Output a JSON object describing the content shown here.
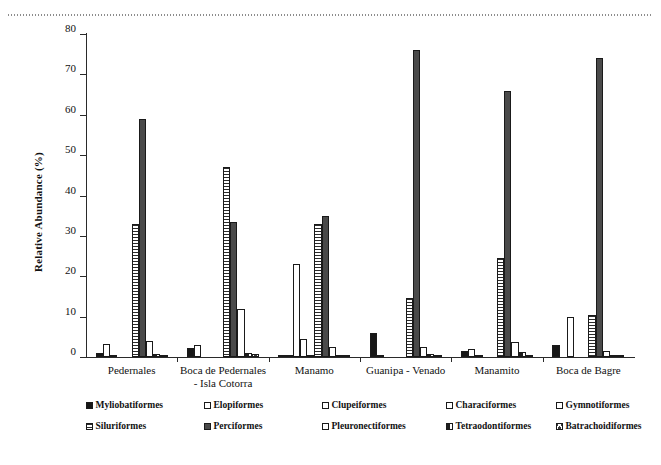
{
  "figure": {
    "y_axis_title": "Relative Abundance (%)",
    "decor": {
      "top_dotted_rule": "dotted-rule"
    }
  },
  "chart_data": {
    "type": "bar",
    "title": "",
    "xlabel": "",
    "ylabel": "Relative Abundance (%)",
    "ylim": [
      0,
      80
    ],
    "yticks": [
      0,
      10,
      20,
      30,
      40,
      50,
      60,
      70,
      80
    ],
    "ytick_labels": [
      "0",
      "10",
      "20",
      "30",
      "40",
      "50",
      "60",
      "70",
      "80"
    ],
    "grid": false,
    "legend_position": "bottom",
    "categories": [
      "Pedernales",
      "Boca de Pedernales - Isla Cotorra",
      "Manamo",
      "Guanipa - Venado",
      "Manamito",
      "Boca de Bagre"
    ],
    "category_lines": [
      [
        "Pedernales"
      ],
      [
        "Boca de Pedernales",
        "- Isla Cotorra"
      ],
      [
        "Manamo"
      ],
      [
        "Guanipa - Venado"
      ],
      [
        "Manamito"
      ],
      [
        "Boca de Bagre"
      ]
    ],
    "series": [
      {
        "name": "Myliobatiformes",
        "fill": "solid",
        "values": [
          1.0,
          2.3,
          0.6,
          6.0,
          1.5,
          3.0
        ]
      },
      {
        "name": "Elopiformes",
        "fill": "empty",
        "values": [
          3.2,
          3.0,
          0.2,
          0.5,
          2.0,
          0.0
        ]
      },
      {
        "name": "Clupeiformes",
        "fill": "empty",
        "values": [
          0.5,
          0.0,
          23.0,
          0.0,
          0.3,
          10.0
        ]
      },
      {
        "name": "Characiformes",
        "fill": "empty",
        "values": [
          0.0,
          0.0,
          4.5,
          0.0,
          0.0,
          0.0
        ]
      },
      {
        "name": "Gymnotiformes",
        "fill": "empty",
        "values": [
          0.0,
          0.0,
          0.3,
          0.0,
          0.0,
          0.0
        ]
      },
      {
        "name": "Siluriformes",
        "fill": "hstripe",
        "values": [
          33.0,
          47.0,
          33.0,
          14.7,
          24.5,
          10.5
        ]
      },
      {
        "name": "Perciformes",
        "fill": "dark",
        "values": [
          59.0,
          33.5,
          35.0,
          76.0,
          66.0,
          74.0
        ]
      },
      {
        "name": "Pleuronectiformes",
        "fill": "empty",
        "values": [
          4.0,
          12.0,
          2.5,
          2.5,
          3.8,
          1.5
        ]
      },
      {
        "name": "Tetraodontiformes",
        "fill": "halfdark",
        "values": [
          0.8,
          0.9,
          0.4,
          0.8,
          1.2,
          0.3
        ]
      },
      {
        "name": "Batrachoidiformes",
        "fill": "cross",
        "values": [
          0.3,
          0.8,
          0.2,
          0.2,
          0.5,
          0.2
        ]
      }
    ]
  },
  "legend": {
    "rows": [
      [
        {
          "label": "Myliobatiformes",
          "fill": "solid"
        },
        {
          "label": "Elopiformes",
          "fill": "empty"
        },
        {
          "label": "Clupeiformes",
          "fill": "empty"
        },
        {
          "label": "Characiformes",
          "fill": "empty"
        },
        {
          "label": "Gymnotiformes",
          "fill": "empty"
        }
      ],
      [
        {
          "label": "Siluriformes",
          "fill": "hstripe"
        },
        {
          "label": "Perciformes",
          "fill": "dark"
        },
        {
          "label": "Pleuronectiformes",
          "fill": "empty"
        },
        {
          "label": "Tetraodontiformes",
          "fill": "halfdark"
        },
        {
          "label": "Batrachoidiformes",
          "fill": "cross"
        }
      ]
    ]
  }
}
